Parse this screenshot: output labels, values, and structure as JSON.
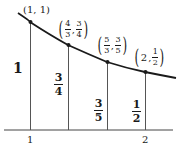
{
  "diagram": {
    "axis": {
      "tick_labels": [
        "1",
        "2"
      ]
    },
    "points": [
      {
        "label": "(1, 1)",
        "x_num": "1",
        "y_num": "1"
      },
      {
        "label": "(4/3, 3/4)",
        "x_num": "4",
        "x_den": "3",
        "y_num": "3",
        "y_den": "4"
      },
      {
        "label": "(5/3, 3/5)",
        "x_num": "5",
        "x_den": "3",
        "y_num": "3",
        "y_den": "5"
      },
      {
        "label": "(2, 1/2)",
        "x_val": "2",
        "y_num": "1",
        "y_den": "2"
      }
    ],
    "heights": [
      {
        "value": "1"
      },
      {
        "num": "3",
        "den": "4"
      },
      {
        "num": "3",
        "den": "5"
      },
      {
        "num": "1",
        "den": "2"
      }
    ],
    "colors": {
      "ink": "#1a1a1a",
      "thin": "#555555",
      "background": "#ffffff"
    }
  }
}
